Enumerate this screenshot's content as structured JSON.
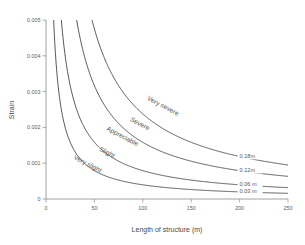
{
  "chart_data": {
    "type": "line",
    "title": "",
    "xlabel": "Length of structure  (m)",
    "ylabel": "Strain",
    "xlim": [
      0,
      250
    ],
    "ylim": [
      0,
      0.005
    ],
    "grid": false,
    "legend_position": "inline-curve-end-labels",
    "xticks": [
      0,
      50,
      100,
      150,
      200,
      250
    ],
    "xtick_labels": [
      "0",
      "50",
      "100",
      "150",
      "200",
      "250"
    ],
    "yticks": [
      0,
      0.001,
      0.002,
      0.003,
      0.004,
      0.005
    ],
    "ytick_labels": [
      "0",
      "0.001",
      "0.002",
      "0.003",
      "0.004",
      "0.005"
    ],
    "series": [
      {
        "name": "0.18m",
        "end_label": "0.18m",
        "coefficient": 0.2375,
        "x": [
          6,
          10,
          15,
          20,
          30,
          40,
          50,
          60,
          80,
          100,
          125,
          150,
          175,
          200,
          225,
          250
        ],
        "values": [
          0.005,
          0.005,
          0.005,
          0.005,
          0.005,
          0.00475,
          0.0038,
          0.00317,
          0.00238,
          0.0019,
          0.00152,
          0.00127,
          0.00109,
          0.00095,
          0.00084,
          0.00095
        ]
      },
      {
        "name": "0.12m",
        "end_label": "0.12m",
        "coefficient": 0.1583,
        "x": [
          6,
          10,
          15,
          20,
          30,
          40,
          50,
          60,
          80,
          100,
          125,
          150,
          175,
          200,
          225,
          250
        ],
        "values": [
          0.005,
          0.005,
          0.005,
          0.005,
          0.00475,
          0.00356,
          0.00285,
          0.00238,
          0.00178,
          0.00142,
          0.00114,
          0.00095,
          0.00081,
          0.00071,
          0.00063,
          0.00065
        ]
      },
      {
        "name": "0.06 m",
        "end_label": "0.06 m",
        "coefficient": 0.0792,
        "x": [
          6,
          10,
          15,
          20,
          30,
          40,
          50,
          60,
          80,
          100,
          125,
          150,
          175,
          200,
          225,
          250
        ],
        "values": [
          0.005,
          0.005,
          0.005,
          0.00396,
          0.00264,
          0.00198,
          0.00158,
          0.00132,
          0.00099,
          0.00079,
          0.00063,
          0.00053,
          0.00045,
          0.0004,
          0.00035,
          0.00032
        ]
      },
      {
        "name": "0.03 m",
        "end_label": "0.03 m",
        "coefficient": 0.0396,
        "x": [
          6,
          10,
          15,
          20,
          30,
          40,
          50,
          60,
          80,
          100,
          125,
          150,
          175,
          200,
          225,
          250
        ],
        "values": [
          0.005,
          0.005,
          0.00264,
          0.00198,
          0.00132,
          0.00099,
          0.00079,
          0.00066,
          0.0005,
          0.0004,
          0.00032,
          0.00026,
          0.00023,
          0.0002,
          0.00018,
          0.00016
        ]
      }
    ],
    "zone_labels": [
      {
        "text": "Very severe",
        "x": 120,
        "y": 0.00255
      },
      {
        "text": "Severe",
        "x": 96,
        "y": 0.00205
      },
      {
        "text": "Appreciable",
        "x": 78,
        "y": 0.0017
      },
      {
        "text": "Slight",
        "x": 62,
        "y": 0.00125
      },
      {
        "text": "Very slight",
        "x": 42,
        "y": 0.00093
      }
    ]
  },
  "colors": {
    "curve": "#3a3a3a",
    "axis": "#8a8a8a",
    "text": "#5a5a5a",
    "background": "#ffffff"
  }
}
